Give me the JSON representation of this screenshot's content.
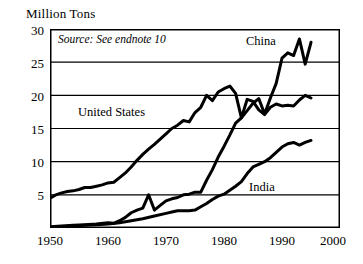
{
  "chart_data": {
    "type": "line",
    "title": "Million Tons",
    "xlabel": "",
    "ylabel": "Million Tons",
    "xlim": [
      1950,
      2000
    ],
    "ylim": [
      0,
      30
    ],
    "grid": true,
    "grid_axis": "y",
    "legend": "inline-labels",
    "annotations": [
      {
        "name": "source",
        "text": "Source: See endnote 10"
      }
    ],
    "xticks": [
      1950,
      1960,
      1970,
      1980,
      1990,
      2000
    ],
    "xtick_labels": [
      "1950",
      "1960",
      "1970",
      "1980",
      "1990",
      "2000"
    ],
    "yticks": [
      5,
      10,
      15,
      20,
      25,
      30
    ],
    "ytick_labels": [
      "5",
      "10",
      "15",
      "20",
      "25",
      "30"
    ],
    "series": [
      {
        "name": "United States",
        "label": "United States",
        "color": "#000000",
        "x": [
          1950,
          1951,
          1952,
          1953,
          1954,
          1955,
          1956,
          1957,
          1958,
          1959,
          1960,
          1961,
          1962,
          1963,
          1964,
          1965,
          1966,
          1967,
          1968,
          1969,
          1970,
          1971,
          1972,
          1973,
          1974,
          1975,
          1976,
          1977,
          1978,
          1979,
          1980,
          1981,
          1982,
          1983,
          1984,
          1985,
          1986,
          1987,
          1988,
          1989,
          1990,
          1991,
          1992,
          1993,
          1994,
          1995
        ],
        "values": [
          4.5,
          5.0,
          5.3,
          5.5,
          5.6,
          5.8,
          6.1,
          6.1,
          6.3,
          6.5,
          6.8,
          6.9,
          7.6,
          8.3,
          9.2,
          10.2,
          11.1,
          11.9,
          12.6,
          13.4,
          14.2,
          15.0,
          15.5,
          16.2,
          16.0,
          17.4,
          18.2,
          20.0,
          19.2,
          20.5,
          21.0,
          21.4,
          20.3,
          16.6,
          19.4,
          19.1,
          17.8,
          17.1,
          18.2,
          18.7,
          18.4,
          18.5,
          18.4,
          19.3,
          20.0,
          19.6
        ]
      },
      {
        "name": "China",
        "label": "China",
        "color": "#000000",
        "x": [
          1950,
          1952,
          1954,
          1956,
          1958,
          1960,
          1961,
          1962,
          1963,
          1964,
          1965,
          1966,
          1967,
          1968,
          1969,
          1970,
          1971,
          1972,
          1973,
          1974,
          1975,
          1976,
          1977,
          1978,
          1979,
          1980,
          1981,
          1982,
          1983,
          1984,
          1985,
          1986,
          1987,
          1988,
          1989,
          1990,
          1991,
          1992,
          1993,
          1994,
          1995
        ],
        "values": [
          0.2,
          0.3,
          0.4,
          0.5,
          0.6,
          0.8,
          0.7,
          1.1,
          1.6,
          2.3,
          2.7,
          3.0,
          5.0,
          2.7,
          3.4,
          4.1,
          4.4,
          4.6,
          5.0,
          5.1,
          5.4,
          5.4,
          7.2,
          8.8,
          10.7,
          12.3,
          14.0,
          15.8,
          16.6,
          17.7,
          18.8,
          19.5,
          17.2,
          19.6,
          21.8,
          25.6,
          26.4,
          26.0,
          28.5,
          24.7,
          28.0
        ]
      },
      {
        "name": "India",
        "label": "India",
        "color": "#000000",
        "x": [
          1950,
          1952,
          1954,
          1956,
          1958,
          1960,
          1962,
          1964,
          1966,
          1968,
          1970,
          1971,
          1972,
          1973,
          1974,
          1975,
          1976,
          1977,
          1978,
          1979,
          1980,
          1981,
          1982,
          1983,
          1984,
          1985,
          1986,
          1987,
          1988,
          1989,
          1990,
          1991,
          1992,
          1993,
          1994,
          1995
        ],
        "values": [
          0.1,
          0.2,
          0.3,
          0.4,
          0.5,
          0.6,
          0.8,
          1.1,
          1.4,
          1.8,
          2.2,
          2.4,
          2.6,
          2.6,
          2.6,
          2.7,
          3.2,
          3.7,
          4.3,
          4.8,
          5.1,
          5.7,
          6.3,
          7.0,
          8.2,
          9.2,
          9.6,
          10.0,
          10.6,
          11.4,
          12.2,
          12.7,
          12.9,
          12.5,
          12.9,
          13.2
        ]
      }
    ]
  },
  "axis": {
    "title": "Million Tons",
    "ytick_0": "30",
    "ytick_1": "25",
    "ytick_2": "20",
    "ytick_3": "15",
    "ytick_4": "10",
    "ytick_5": "5",
    "xtick_0": "1950",
    "xtick_1": "1960",
    "xtick_2": "1970",
    "xtick_3": "1980",
    "xtick_4": "1990",
    "xtick_5": "2000"
  },
  "source_note": "Source: See endnote 10",
  "labels": {
    "united_states": "United States",
    "china": "China",
    "india": "India"
  }
}
